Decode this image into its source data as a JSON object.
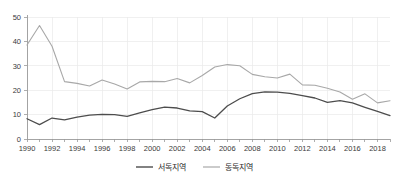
{
  "chart_data": {
    "type": "line",
    "title": "",
    "subtitle": "",
    "xlabel": "",
    "ylabel": "",
    "xlim": [
      1990,
      2019
    ],
    "ylim": [
      0,
      50
    ],
    "yticks": [
      0,
      10,
      20,
      30,
      40,
      50
    ],
    "ytick_labels": [
      "0",
      "10",
      "20",
      "30",
      "40",
      "50"
    ],
    "xticks": [
      1990,
      1992,
      1994,
      1996,
      1998,
      2000,
      2002,
      2004,
      2006,
      2008,
      2010,
      2012,
      2014,
      2016,
      2018
    ],
    "xtick_labels": [
      "1990",
      "1992",
      "1994",
      "1996",
      "1998",
      "2000",
      "2002",
      "2004",
      "2006",
      "2008",
      "2010",
      "2012",
      "2014",
      "2016",
      "2018"
    ],
    "x": [
      1990,
      1991,
      1992,
      1993,
      1994,
      1995,
      1996,
      1997,
      1998,
      1999,
      2000,
      2001,
      2002,
      2003,
      2004,
      2005,
      2006,
      2007,
      2008,
      2009,
      2010,
      2011,
      2012,
      2013,
      2014,
      2015,
      2016,
      2017,
      2018,
      2019
    ],
    "grid": true,
    "grid_axis": "both",
    "legend_position": "bottom",
    "series": [
      {
        "name": "서독지역",
        "color": "#4d4d4d",
        "linewidth": 1.3,
        "values": [
          8.3,
          5.9,
          8.6,
          7.8,
          9.0,
          9.8,
          10.1,
          10.0,
          9.3,
          10.7,
          12.0,
          13.1,
          12.7,
          11.5,
          11.2,
          8.6,
          13.5,
          16.5,
          18.6,
          19.3,
          19.2,
          18.7,
          17.8,
          16.8,
          15.0,
          15.7,
          14.8,
          13.0,
          11.3,
          9.6
        ]
      },
      {
        "name": "동독지역",
        "color": "#a8a8a8",
        "linewidth": 1.1,
        "values": [
          38.5,
          46.5,
          38.0,
          23.5,
          22.8,
          21.7,
          24.2,
          22.5,
          20.5,
          23.4,
          23.6,
          23.5,
          24.8,
          23.0,
          26.0,
          29.5,
          30.5,
          30.0,
          26.5,
          25.5,
          25.0,
          26.6,
          22.2,
          22.0,
          20.8,
          19.3,
          16.3,
          18.5,
          14.8,
          15.7
        ]
      }
    ]
  },
  "legend": {
    "items": [
      {
        "label": "서독지역",
        "color": "#4d4d4d"
      },
      {
        "label": "동독지역",
        "color": "#a8a8a8"
      }
    ]
  },
  "axes": {
    "y_axis_name": "value-axis",
    "x_axis_name": "year-axis"
  }
}
